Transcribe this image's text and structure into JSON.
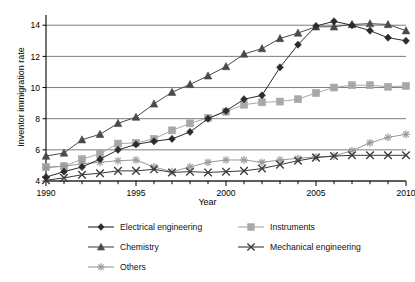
{
  "chart_data": {
    "type": "line",
    "title": "",
    "xlabel": "Year",
    "ylabel": "Inventor immigration rate",
    "xlim": [
      1990,
      2010
    ],
    "ylim": [
      4,
      14.4
    ],
    "xticks": [
      1990,
      1995,
      2000,
      2005,
      2010
    ],
    "xticklabels": [
      "1990",
      "1995",
      "2000",
      "2005",
      "2010"
    ],
    "yticks": [
      4,
      6,
      8,
      10,
      12,
      14
    ],
    "yticklabels": [
      "4",
      "6",
      "8",
      "10",
      "12",
      "14"
    ],
    "grid": "horizontal",
    "legend_position": "below",
    "x": [
      1990,
      1991,
      1992,
      1993,
      1994,
      1995,
      1996,
      1997,
      1998,
      1999,
      2000,
      2001,
      2002,
      2003,
      2004,
      2005,
      2006,
      2007,
      2008,
      2009,
      2010
    ],
    "series": [
      {
        "name": "Electrical engineering",
        "marker": "diamond",
        "color": "#2b2b2b",
        "values": [
          4.25,
          4.6,
          4.9,
          5.4,
          6.0,
          6.35,
          6.55,
          6.7,
          7.15,
          8.0,
          8.5,
          9.25,
          9.5,
          11.3,
          12.75,
          13.95,
          14.25,
          14.0,
          13.65,
          13.2,
          13.0
        ]
      },
      {
        "name": "Instruments",
        "marker": "square",
        "color": "#a8a8a8",
        "values": [
          4.9,
          4.95,
          5.4,
          5.75,
          6.4,
          6.45,
          6.7,
          7.25,
          7.7,
          8.05,
          8.45,
          8.9,
          9.05,
          9.1,
          9.25,
          9.65,
          10.0,
          10.15,
          10.15,
          10.05,
          10.1
        ]
      },
      {
        "name": "Chemistry",
        "marker": "triangle",
        "color": "#4a4a4a",
        "values": [
          5.6,
          5.8,
          6.65,
          7.0,
          7.7,
          8.1,
          8.95,
          9.7,
          10.2,
          10.75,
          11.35,
          12.15,
          12.5,
          13.15,
          13.5,
          13.9,
          13.9,
          14.05,
          14.1,
          14.05,
          13.65
        ]
      },
      {
        "name": "Mechanical engineering",
        "marker": "x",
        "color": "#3a3a3a",
        "values": [
          4.05,
          4.2,
          4.4,
          4.5,
          4.65,
          4.65,
          4.75,
          4.55,
          4.6,
          4.55,
          4.6,
          4.65,
          4.8,
          5.05,
          5.3,
          5.5,
          5.6,
          5.65,
          5.65,
          5.65,
          5.65
        ]
      },
      {
        "name": "Others",
        "marker": "asterisk",
        "color": "#9a9a9a",
        "values": [
          4.85,
          4.95,
          5.1,
          5.2,
          5.3,
          5.35,
          4.9,
          4.6,
          4.9,
          5.2,
          5.35,
          5.35,
          5.2,
          5.35,
          5.45,
          5.55,
          5.6,
          5.95,
          6.45,
          6.8,
          7.0
        ]
      }
    ]
  },
  "legend": {
    "entries": [
      {
        "label": "Electrical engineering",
        "marker": "diamond",
        "color": "#2b2b2b"
      },
      {
        "label": "Instruments",
        "marker": "square",
        "color": "#a8a8a8"
      },
      {
        "label": "Chemistry",
        "marker": "triangle",
        "color": "#4a4a4a"
      },
      {
        "label": "Mechanical engineering",
        "marker": "x",
        "color": "#3a3a3a"
      },
      {
        "label": "Others",
        "marker": "asterisk",
        "color": "#9a9a9a"
      }
    ]
  }
}
